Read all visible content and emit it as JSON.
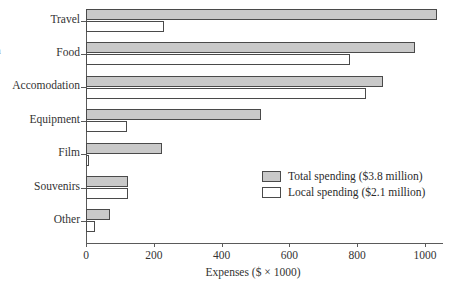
{
  "edge_fragment": "a",
  "chart_data": {
    "type": "bar",
    "orientation": "horizontal",
    "title": "",
    "xlabel": "Expenses ($ × 1000)",
    "ylabel": "",
    "xlim": [
      0,
      1100
    ],
    "grid": false,
    "legend_position": "inside-right",
    "categories": [
      "Travel",
      "Food",
      "Accomodation",
      "Equipment",
      "Film",
      "Souvenirs",
      "Other"
    ],
    "xticks": [
      0,
      200,
      400,
      600,
      800,
      1000
    ],
    "xticklabels": [
      "0",
      "200",
      "400",
      "600",
      "800",
      "1000"
    ],
    "series": [
      {
        "name": "Total spending ($3.8 million)",
        "color": "#c9c9c9",
        "values": [
          1035,
          970,
          875,
          515,
          225,
          125,
          70
        ]
      },
      {
        "name": "Local spending ($2.1 million)",
        "color": "#ffffff",
        "values": [
          230,
          780,
          825,
          120,
          10,
          125,
          28
        ]
      }
    ]
  }
}
